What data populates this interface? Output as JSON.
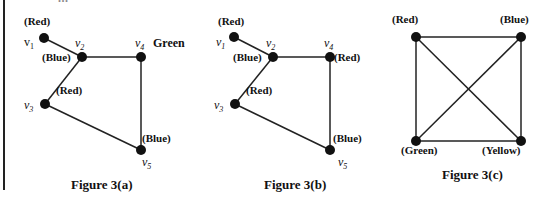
{
  "header": {
    "truncated_text": "..."
  },
  "figures": [
    {
      "caption": "Figure 3(a)",
      "vertices": [
        {
          "id": "v1",
          "label": "v",
          "sub": "1",
          "color_label": "(Red)"
        },
        {
          "id": "v2",
          "label": "v",
          "sub": "2",
          "color_label": "(Blue)"
        },
        {
          "id": "v3",
          "label": "v",
          "sub": "3",
          "color_label": "(Red)"
        },
        {
          "id": "v4",
          "label": "v",
          "sub": "4",
          "color_label": "Green"
        },
        {
          "id": "v5",
          "label": "v",
          "sub": "5",
          "color_label": "(Blue)"
        }
      ],
      "edges": [
        [
          "v1",
          "v2"
        ],
        [
          "v2",
          "v4"
        ],
        [
          "v2",
          "v3"
        ],
        [
          "v4",
          "v5"
        ],
        [
          "v3",
          "v5"
        ]
      ]
    },
    {
      "caption": "Figure 3(b)",
      "vertices": [
        {
          "id": "v1",
          "label": "v",
          "sub": "1",
          "color_label": "(Red)"
        },
        {
          "id": "v2",
          "label": "v",
          "sub": "2",
          "color_label": "(Blue)"
        },
        {
          "id": "v3",
          "label": "v",
          "sub": "3",
          "color_label": "(Red)"
        },
        {
          "id": "v4",
          "label": "v",
          "sub": "4",
          "color_label": "(Red)"
        },
        {
          "id": "v5",
          "label": "v",
          "sub": "5",
          "color_label": "(Blue)"
        }
      ],
      "edges": [
        [
          "v1",
          "v2"
        ],
        [
          "v2",
          "v4"
        ],
        [
          "v2",
          "v3"
        ],
        [
          "v4",
          "v5"
        ],
        [
          "v3",
          "v5"
        ]
      ]
    },
    {
      "caption": "Figure 3(c)",
      "vertices": [
        {
          "id": "tl",
          "color_label": "(Red)"
        },
        {
          "id": "tr",
          "color_label": "(Blue)"
        },
        {
          "id": "bl",
          "color_label": "(Green)"
        },
        {
          "id": "br",
          "color_label": "(Yellow)"
        }
      ],
      "edges": [
        [
          "tl",
          "tr"
        ],
        [
          "tl",
          "bl"
        ],
        [
          "tr",
          "br"
        ],
        [
          "bl",
          "br"
        ],
        [
          "tl",
          "br"
        ],
        [
          "tr",
          "bl"
        ]
      ]
    }
  ]
}
